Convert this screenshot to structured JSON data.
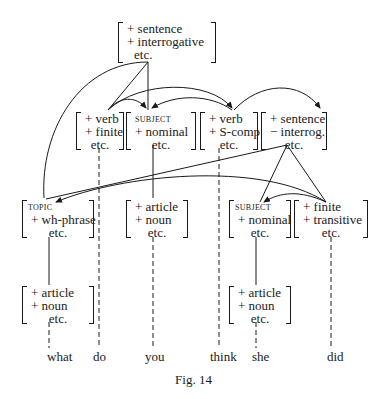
{
  "figure": {
    "caption": "Fig. 14",
    "nodes": {
      "root": {
        "rows": [
          "+ sentence",
          "+ interrogative"
        ],
        "etc": "etc."
      },
      "verb_do": {
        "rows": [
          "+ verb",
          "+ finite"
        ],
        "etc": "etc."
      },
      "subject_you": {
        "head": "subject",
        "rows": [
          "+ nominal"
        ],
        "etc": "etc."
      },
      "verb_think": {
        "rows": [
          "+ verb",
          "+ S-comp"
        ],
        "etc": "etc."
      },
      "embedded_s": {
        "rows": [
          "+ sentence",
          "− interrog."
        ],
        "etc": "etc."
      },
      "topic": {
        "head": "topic",
        "rows": [
          "+ wh-phrase"
        ],
        "etc": "etc."
      },
      "noun_you": {
        "rows": [
          "+ article",
          "+ noun"
        ],
        "etc": "etc."
      },
      "subject_she": {
        "head": "subject",
        "rows": [
          "+ nominal"
        ],
        "etc": "etc."
      },
      "finite_did": {
        "rows": [
          "+ finite",
          "+ transitive"
        ],
        "etc": "etc."
      },
      "noun_what": {
        "rows": [
          "+ article",
          "+ noun"
        ],
        "etc": "etc."
      },
      "noun_she": {
        "rows": [
          "+ article",
          "+ noun"
        ],
        "etc": "etc."
      }
    },
    "words": [
      "what",
      "do",
      "you",
      "think",
      "she",
      "did"
    ]
  }
}
